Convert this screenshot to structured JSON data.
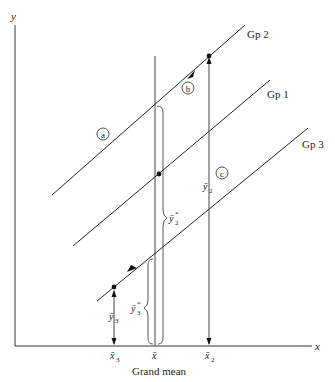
{
  "diagram": {
    "axes": {
      "x_label": "x",
      "y_label": "y"
    },
    "lines": [
      {
        "name": "Gp 2",
        "label": "Gp 2"
      },
      {
        "name": "Gp 1",
        "label": "Gp 1"
      },
      {
        "name": "Gp 3",
        "label": "Gp 3"
      }
    ],
    "markers": {
      "a": "a",
      "b": "b",
      "c": "c"
    },
    "x_ticks": {
      "x3": "x̄",
      "x3_sub": "3",
      "xbar": "x̄",
      "x2": "x̄",
      "x2_sub": "2"
    },
    "y_labels": {
      "y3": "ȳ",
      "y3_sub": "3",
      "y2": "ȳ",
      "y2_sub": "2",
      "y3_adj": "ȳ",
      "y3_adj_sub": "3",
      "y3_adj_sup": "*",
      "y2_adj": "ȳ",
      "y2_adj_sub": "2",
      "y2_adj_sup": "*"
    },
    "caption": "Grand mean"
  }
}
